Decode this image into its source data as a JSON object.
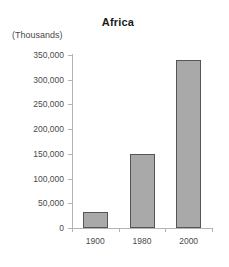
{
  "chart_data": {
    "type": "bar",
    "title": "Africa",
    "unit_label": "(Thousands)",
    "xlabel": "",
    "ylabel": "",
    "categories": [
      "1900",
      "1980",
      "2000"
    ],
    "values": [
      33000,
      150000,
      340000
    ],
    "ylim": [
      0,
      350000
    ],
    "ytick_labels": [
      "0",
      "50,000",
      "100,000",
      "150,000",
      "200,000",
      "250,000",
      "300,000",
      "350,000"
    ],
    "ytick_values": [
      0,
      50000,
      100000,
      150000,
      200000,
      250000,
      300000,
      350000
    ],
    "grid": false,
    "legend": "none",
    "bar_fill_color": "#a9a9a9",
    "bar_border_color": "#555555",
    "axis_color": "#b4b4b4",
    "background_color": "#ffffff"
  }
}
